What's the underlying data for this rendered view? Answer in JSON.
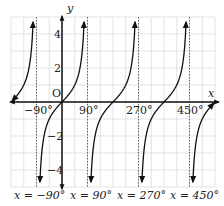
{
  "chart_data": {
    "type": "line",
    "title": "",
    "function": "y = tan x",
    "xlabel": "x",
    "ylabel": "y",
    "origin_label": "O",
    "xlim": [
      -180,
      540
    ],
    "ylim": [
      -5,
      5
    ],
    "grid": true,
    "x_grid_step": 45,
    "y_grid_step": 1,
    "x_tick_labels": [
      {
        "value": -90,
        "label": "−90°"
      },
      {
        "value": 90,
        "label": "90°"
      },
      {
        "value": 270,
        "label": "270°"
      },
      {
        "value": 450,
        "label": "450°"
      }
    ],
    "y_tick_labels": [
      {
        "value": 4,
        "label": "4"
      },
      {
        "value": 2,
        "label": "2"
      },
      {
        "value": -2,
        "label": "−2"
      },
      {
        "value": -4,
        "label": "−4"
      }
    ],
    "asymptotes": [
      {
        "x": -90,
        "label": "x = −90°"
      },
      {
        "x": 90,
        "label": "x = 90°"
      },
      {
        "x": 270,
        "label": "x = 270°"
      },
      {
        "x": 450,
        "label": "x = 450°"
      }
    ],
    "series": [
      {
        "name": "tan x",
        "branches": [
          [
            -180,
            -90
          ],
          [
            -90,
            90
          ],
          [
            90,
            270
          ],
          [
            270,
            450
          ],
          [
            450,
            540
          ]
        ],
        "sample_points": [
          [
            -180,
            0
          ],
          [
            -45,
            -1
          ],
          [
            0,
            0
          ],
          [
            45,
            1
          ],
          [
            180,
            0
          ],
          [
            225,
            1
          ],
          [
            360,
            0
          ],
          [
            405,
            1
          ],
          [
            540,
            0
          ]
        ]
      }
    ]
  },
  "labels": {
    "x_axis": "x",
    "y_axis": "y",
    "origin": "O",
    "tick_m90": "−90°",
    "tick_90": "90°",
    "tick_270": "270°",
    "tick_450": "450°",
    "tick_4": "4",
    "tick_2": "2",
    "tick_m2": "−2",
    "tick_m4": "−4",
    "asym_m90": "x = −90°",
    "asym_90": "x = 90°",
    "asym_270": "x = 270°",
    "asym_450": "x = 450°"
  }
}
